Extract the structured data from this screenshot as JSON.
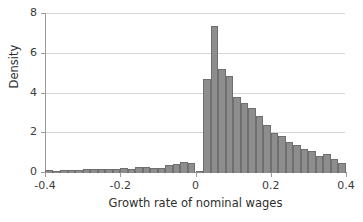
{
  "chart_data": {
    "type": "bar",
    "subtype": "histogram",
    "title": "",
    "xlabel": "Growth rate of nominal wages",
    "ylabel": "Density",
    "xlim": [
      -0.4,
      0.4
    ],
    "ylim": [
      0,
      8
    ],
    "xticks": [
      -0.4,
      -0.2,
      0,
      0.2,
      0.4
    ],
    "xtick_labels": [
      "-0.4",
      "-0.2",
      "0",
      "0.2",
      "0.4"
    ],
    "yticks": [
      0,
      2,
      4,
      6,
      8
    ],
    "ytick_labels": [
      "0",
      "2",
      "4",
      "6",
      "8"
    ],
    "grid": "horizontal",
    "legend": "none",
    "bin_width": 0.02,
    "bar_color": "#8d8d8d",
    "bar_edge_color": "#6f6f6f",
    "grid_color": "#d6d6d6",
    "axis_color": "#9a9a9a",
    "text_color": "#2e2e2e",
    "bin_left_edges": [
      -0.4,
      -0.38,
      -0.36,
      -0.34,
      -0.32,
      -0.3,
      -0.28,
      -0.26,
      -0.24,
      -0.22,
      -0.2,
      -0.18,
      -0.16,
      -0.14,
      -0.12,
      -0.1,
      -0.08,
      -0.06,
      -0.04,
      -0.02,
      0.0,
      0.02,
      0.04,
      0.06,
      0.08,
      0.1,
      0.12,
      0.14,
      0.16,
      0.18,
      0.2,
      0.22,
      0.24,
      0.26,
      0.28,
      0.3,
      0.32,
      0.34,
      0.36,
      0.38
    ],
    "values": [
      0.15,
      0.12,
      0.14,
      0.13,
      0.16,
      0.21,
      0.2,
      0.19,
      0.21,
      0.18,
      0.24,
      0.22,
      0.3,
      0.32,
      0.24,
      0.25,
      0.42,
      0.47,
      0.55,
      0.52,
      0.12,
      4.72,
      7.4,
      5.25,
      4.88,
      3.82,
      3.5,
      3.26,
      2.86,
      2.4,
      2.02,
      1.85,
      1.55,
      1.42,
      1.2,
      1.12,
      0.88,
      0.95,
      0.72,
      0.52
    ]
  }
}
